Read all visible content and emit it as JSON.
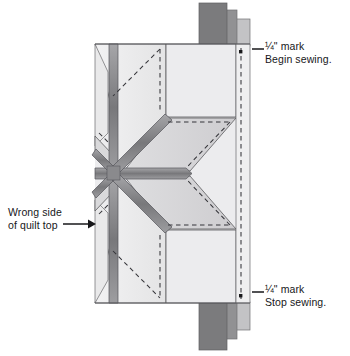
{
  "diagram": {
    "type": "quilting-instruction-illustration",
    "labels": {
      "begin": {
        "line1": "¼\" mark",
        "line2": "Begin sewing."
      },
      "stop": {
        "line1": "¼\" mark",
        "line2": "Stop sewing."
      },
      "wrong": {
        "line1": "Wrong side",
        "line2": "of quilt top"
      }
    },
    "colors": {
      "fabric_lightest": "#ececed",
      "fabric_light": "#e3e3e4",
      "fabric_mid": "#d4d4d6",
      "fabric_midgray": "#c8c8ca",
      "seam_dark": "#7d7d80",
      "seam_mid": "#9a9a9d",
      "strip_dark": "#7b7b7d",
      "strip_mid": "#919193",
      "strip_light": "#c3c3c5",
      "outline": "#4c4c4f",
      "dash": "#3b3b3e",
      "text": "#17171a"
    },
    "elements": {
      "strips_top": 3,
      "strips_bottom": 3,
      "mark_dots": 2,
      "center_point": {
        "x": 113,
        "y": 173
      }
    }
  }
}
